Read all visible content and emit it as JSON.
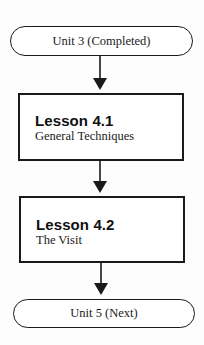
{
  "diagram": {
    "type": "flowchart",
    "direction": "top-to-bottom",
    "nodes": [
      {
        "id": "unit3",
        "shape": "terminator",
        "label": "Unit 3 (Completed)"
      },
      {
        "id": "lesson41",
        "shape": "process",
        "title": "Lesson 4.1",
        "subtitle": "General Techniques"
      },
      {
        "id": "lesson42",
        "shape": "process",
        "title": "Lesson 4.2",
        "subtitle": "The Visit"
      },
      {
        "id": "unit5",
        "shape": "terminator",
        "label": "Unit 5 (Next)"
      }
    ],
    "edges": [
      {
        "from": "unit3",
        "to": "lesson41"
      },
      {
        "from": "lesson41",
        "to": "lesson42"
      },
      {
        "from": "lesson42",
        "to": "unit5"
      }
    ],
    "colors": {
      "stroke": "#1a1a1a",
      "fill": "#ffffff",
      "text": "#1a1a1a"
    }
  }
}
